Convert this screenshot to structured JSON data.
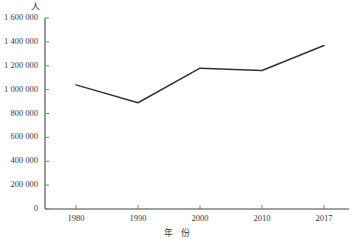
{
  "chart_data": {
    "type": "line",
    "title": "",
    "xlabel": "年  份",
    "ylabel": "",
    "y_unit_label": "人",
    "categories": [
      "1980",
      "1990",
      "2000",
      "2010",
      "2017"
    ],
    "x": [
      1980,
      1990,
      2000,
      2010,
      2017
    ],
    "values": [
      1040000,
      890000,
      1180000,
      1160000,
      1370000
    ],
    "series": [
      {
        "name": "人数",
        "values": [
          1040000,
          890000,
          1180000,
          1160000,
          1370000
        ]
      }
    ],
    "ylim": [
      0,
      1600000
    ],
    "y_ticks": [
      0,
      200000,
      400000,
      600000,
      800000,
      1000000,
      1200000,
      1400000,
      1600000
    ],
    "y_tick_labels": [
      "0",
      "200 000",
      "400 000",
      "600 000",
      "800 000",
      "1 000 000",
      "1 200 000",
      "1 400 000",
      "1 600 000"
    ],
    "x_tick_labels": [
      "1980",
      "1990",
      "2000",
      "2010",
      "2017"
    ],
    "grid": false,
    "legend": false,
    "legend_position": "none",
    "line_color": "#333333",
    "axis_color": "#808080",
    "background_color": "#ffffff"
  }
}
